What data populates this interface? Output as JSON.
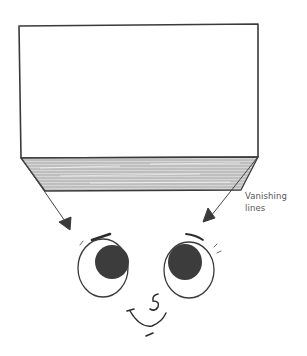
{
  "figure": {
    "annotation": {
      "line1": "Vanishing",
      "line2": "lines"
    },
    "elements": {
      "front_face": "rectangle",
      "bottom_face": "shaded trapezoid in perspective",
      "arrows": 2,
      "character": "cartoon face looking up with large eyes"
    },
    "colors": {
      "stroke": "#3a3a3a",
      "shading": "#b8b8b8",
      "pupil": "#3c3c3c",
      "label": "#555555",
      "background": "#ffffff"
    }
  }
}
